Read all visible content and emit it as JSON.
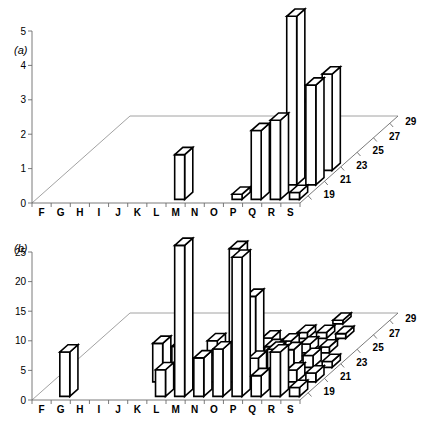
{
  "figure": {
    "width": 444,
    "height": 429,
    "background": "#ffffff",
    "ink": "#000000",
    "axis_color": "#6b6b6b"
  },
  "chart_data": [
    {
      "id": "panel-a",
      "type": "bar",
      "projection": "3d",
      "title": "(a)",
      "xlabel": "",
      "ylabel": "",
      "zlabel": "",
      "categories": [
        "F",
        "G",
        "H",
        "I",
        "J",
        "K",
        "L",
        "M",
        "N",
        "O",
        "P",
        "Q",
        "R",
        "S"
      ],
      "depth_ticks": [
        19,
        21,
        23,
        25,
        27,
        29
      ],
      "depth_range": [
        18,
        30
      ],
      "ytick_labels": [
        "0",
        "1",
        "2",
        "3",
        "4",
        "5"
      ],
      "yticks": [
        0,
        1,
        2,
        3,
        4,
        5
      ],
      "ylim": [
        0,
        5
      ],
      "grid": false,
      "legend": false,
      "points": [
        {
          "x": "M",
          "z": 19,
          "value": 1.3
        },
        {
          "x": "P",
          "z": 19,
          "value": 0.15
        },
        {
          "x": "Q",
          "z": 19,
          "value": 2.0
        },
        {
          "x": "R",
          "z": 19,
          "value": 2.3
        },
        {
          "x": "S",
          "z": 19,
          "value": 0.2
        },
        {
          "x": "Q",
          "z": 21,
          "value": 1.6
        },
        {
          "x": "R",
          "z": 21,
          "value": 4.9
        },
        {
          "x": "S",
          "z": 21,
          "value": 2.9
        },
        {
          "x": "Q",
          "z": 23,
          "value": 1.1
        },
        {
          "x": "R",
          "z": 23,
          "value": 2.0
        },
        {
          "x": "S",
          "z": 23,
          "value": 2.8
        }
      ]
    },
    {
      "id": "panel-b",
      "type": "bar",
      "projection": "3d",
      "title": "(b)",
      "xlabel": "",
      "ylabel": "",
      "zlabel": "",
      "categories": [
        "F",
        "G",
        "H",
        "I",
        "J",
        "K",
        "L",
        "M",
        "N",
        "O",
        "P",
        "Q",
        "R",
        "S"
      ],
      "depth_ticks": [
        19,
        21,
        23,
        25,
        27,
        29
      ],
      "depth_range": [
        18,
        30
      ],
      "ytick_labels": [
        "0",
        "5",
        "10",
        "15",
        "20",
        "25"
      ],
      "yticks": [
        0,
        5,
        10,
        15,
        20,
        25
      ],
      "ylim": [
        0,
        25
      ],
      "grid": false,
      "legend": false,
      "points": [
        {
          "x": "G",
          "z": 19,
          "value": 7.5
        },
        {
          "x": "L",
          "z": 19,
          "value": 4.5
        },
        {
          "x": "M",
          "z": 19,
          "value": 25.5
        },
        {
          "x": "N",
          "z": 19,
          "value": 6.5
        },
        {
          "x": "O",
          "z": 19,
          "value": 8.0
        },
        {
          "x": "P",
          "z": 19,
          "value": 23.5
        },
        {
          "x": "Q",
          "z": 19,
          "value": 3.5
        },
        {
          "x": "R",
          "z": 19,
          "value": 7.5
        },
        {
          "x": "S",
          "z": 19,
          "value": 1.5
        },
        {
          "x": "K",
          "z": 21,
          "value": 6.5
        },
        {
          "x": "L",
          "z": 21,
          "value": 6.0
        },
        {
          "x": "N",
          "z": 21,
          "value": 4.5
        },
        {
          "x": "O",
          "z": 21,
          "value": 22.5
        },
        {
          "x": "P",
          "z": 21,
          "value": 4.0
        },
        {
          "x": "Q",
          "z": 21,
          "value": 5.5
        },
        {
          "x": "R",
          "z": 21,
          "value": 2.0
        },
        {
          "x": "S",
          "z": 21,
          "value": 1.5
        },
        {
          "x": "M",
          "z": 23,
          "value": 4.5
        },
        {
          "x": "N",
          "z": 23,
          "value": 3.0
        },
        {
          "x": "O",
          "z": 23,
          "value": 12.0
        },
        {
          "x": "P",
          "z": 23,
          "value": 3.5
        },
        {
          "x": "Q",
          "z": 23,
          "value": 3.0
        },
        {
          "x": "R",
          "z": 23,
          "value": 2.0
        },
        {
          "x": "S",
          "z": 23,
          "value": 1.0
        },
        {
          "x": "N",
          "z": 25,
          "value": 2.0
        },
        {
          "x": "O",
          "z": 25,
          "value": 2.5
        },
        {
          "x": "P",
          "z": 25,
          "value": 2.0
        },
        {
          "x": "Q",
          "z": 25,
          "value": 1.5
        },
        {
          "x": "R",
          "z": 25,
          "value": 1.0
        },
        {
          "x": "P",
          "z": 27,
          "value": 1.0
        },
        {
          "x": "Q",
          "z": 27,
          "value": 1.0
        },
        {
          "x": "R",
          "z": 27,
          "value": 0.8
        },
        {
          "x": "Q",
          "z": 29,
          "value": 0.6
        }
      ]
    }
  ]
}
